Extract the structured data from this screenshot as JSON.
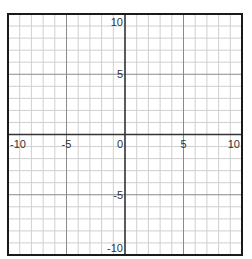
{
  "chart_data": {
    "type": "line",
    "title": "",
    "xlabel": "",
    "ylabel": "",
    "xlim": [
      -10,
      10
    ],
    "ylim": [
      -10,
      10
    ],
    "grid": true,
    "grid_step": 1,
    "major_grid_step": 5,
    "series": [],
    "x_tick_labels": [
      "-10",
      "-5",
      "0",
      "5",
      "10"
    ],
    "y_tick_labels": [
      "10",
      "5",
      "-5",
      "-10"
    ],
    "x_ticks": [
      -10,
      -5,
      0,
      5,
      10
    ],
    "y_ticks": [
      10,
      5,
      -5,
      -10
    ],
    "legend": null
  },
  "colors": {
    "background": "#ffffff",
    "minor_grid": "#cfcfcf",
    "major_grid": "#8a8a8a",
    "axis": "#333333",
    "frame": "#1a1a1a",
    "label": "#333333"
  },
  "layout": {
    "frame": {
      "left": 8,
      "top": 14,
      "right": 242,
      "bottom": 255
    }
  }
}
